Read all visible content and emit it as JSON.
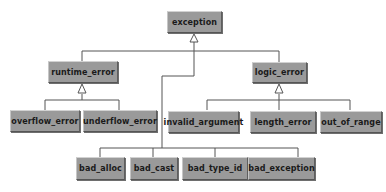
{
  "diagram": {
    "type": "class-hierarchy",
    "colors": {
      "box_fill": "#9a9a9a",
      "box_text": "#1a1a1a",
      "line": "#555555",
      "background": "#ffffff"
    },
    "nodes": {
      "exception": "exception",
      "runtime_error": "runtime_error",
      "logic_error": "logic_error",
      "overflow_error": "overflow_error",
      "underflow_error": "underflow_error",
      "invalid_argument": "invalid_argument",
      "length_error": "length_error",
      "out_of_range": "out_of_range",
      "bad_alloc": "bad_alloc",
      "bad_cast": "bad_cast",
      "bad_type_id": "bad_type_id",
      "bad_exception": "bad_exception"
    },
    "edges": [
      {
        "from": "runtime_error",
        "to": "exception"
      },
      {
        "from": "logic_error",
        "to": "exception"
      },
      {
        "from": "bad_alloc",
        "to": "exception"
      },
      {
        "from": "bad_cast",
        "to": "exception"
      },
      {
        "from": "bad_type_id",
        "to": "exception"
      },
      {
        "from": "bad_exception",
        "to": "exception"
      },
      {
        "from": "overflow_error",
        "to": "runtime_error"
      },
      {
        "from": "underflow_error",
        "to": "runtime_error"
      },
      {
        "from": "invalid_argument",
        "to": "logic_error"
      },
      {
        "from": "length_error",
        "to": "logic_error"
      },
      {
        "from": "out_of_range",
        "to": "logic_error"
      }
    ]
  }
}
